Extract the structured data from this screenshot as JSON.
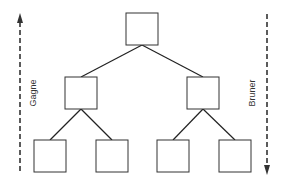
{
  "diagram": {
    "type": "hierarchy-tree",
    "levels": 3,
    "nodes": [
      {
        "id": "root",
        "level": 0
      },
      {
        "id": "mid-left",
        "level": 1,
        "parent": "root"
      },
      {
        "id": "mid-right",
        "level": 1,
        "parent": "root"
      },
      {
        "id": "leaf-1",
        "level": 2,
        "parent": "mid-left"
      },
      {
        "id": "leaf-2",
        "level": 2,
        "parent": "mid-left"
      },
      {
        "id": "leaf-3",
        "level": 2,
        "parent": "mid-right"
      },
      {
        "id": "leaf-4",
        "level": 2,
        "parent": "mid-right"
      }
    ],
    "left_axis": {
      "label": "Gagne",
      "direction": "up",
      "style": "dashed-arrow"
    },
    "right_axis": {
      "label": "Bruner",
      "direction": "down",
      "style": "dashed-arrow"
    },
    "colors": {
      "line": "#222222",
      "box": "#333333",
      "background": "#ffffff"
    }
  }
}
